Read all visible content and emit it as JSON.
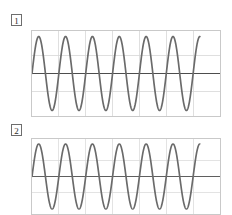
{
  "page": {
    "background_color": "#ffffff",
    "width": 232,
    "height": 215
  },
  "panels": [
    {
      "label": "1"
    },
    {
      "label": "2"
    }
  ],
  "chart_data": [
    {
      "type": "line",
      "title": "1",
      "xlabel": "",
      "ylabel": "",
      "series": [
        {
          "name": "waveform-1",
          "waveform": "sine",
          "cycles": 6.25,
          "amplitude": 1.0,
          "phase_deg": 0,
          "color": "#6a6a6a"
        }
      ],
      "xlim": [
        0,
        6.25
      ],
      "ylim": [
        -1.15,
        1.15
      ],
      "grid": true,
      "grid_color": "#d6d6d6",
      "x_gridlines": 6,
      "y_gridlines": 3,
      "zero_axis": true,
      "zero_axis_color": "#4a4a4a",
      "legend": "none",
      "clipped": false
    },
    {
      "type": "line",
      "title": "2",
      "xlabel": "",
      "ylabel": "",
      "series": [
        {
          "name": "waveform-2",
          "waveform": "sine",
          "cycles": 6.25,
          "amplitude": 1.0,
          "phase_deg": 0,
          "color": "#6a6a6a"
        }
      ],
      "xlim": [
        0,
        6.25
      ],
      "ylim": [
        -1.15,
        1.15
      ],
      "grid": true,
      "grid_color": "#d6d6d6",
      "x_gridlines": 6,
      "y_gridlines": 3,
      "zero_axis": true,
      "zero_axis_color": "#4a4a4a",
      "legend": "none",
      "clipped": true
    }
  ]
}
